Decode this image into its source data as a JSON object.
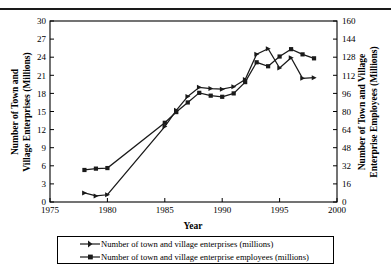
{
  "chart_data": {
    "type": "line",
    "title": "",
    "xlabel": "Year",
    "ylabel": "Number of Town and Village Enterprises (Millions)",
    "y2label": "Number of Town and Village Enterprise Employees (Millions)",
    "xlim": [
      1975,
      2000
    ],
    "xticks": [
      1975,
      1980,
      1985,
      1990,
      1995,
      2000
    ],
    "ylim": [
      0,
      30
    ],
    "yticks": [
      0,
      3,
      6,
      9,
      12,
      15,
      18,
      21,
      24,
      27,
      30
    ],
    "y2lim": [
      0,
      160
    ],
    "y2ticks": [
      0,
      16,
      32,
      48,
      64,
      80,
      96,
      112,
      128,
      144,
      160
    ],
    "grid": false,
    "legend_position": "bottom",
    "series": [
      {
        "name": "Number of town and village enterprises (millions)",
        "axis": "left",
        "marker": "triangle",
        "x": [
          1978,
          1979,
          1980,
          1985,
          1986,
          1987,
          1988,
          1989,
          1990,
          1991,
          1992,
          1993,
          1994,
          1995,
          1996,
          1997,
          1998
        ],
        "values": [
          1.5,
          1.0,
          1.2,
          12.5,
          15.2,
          17.5,
          19.0,
          18.8,
          18.7,
          19.1,
          20.3,
          24.5,
          25.4,
          22.2,
          23.9,
          20.5,
          20.6
        ]
      },
      {
        "name": "Number of town and village enterprise employees (millions)",
        "axis": "right",
        "marker": "square",
        "x": [
          1978,
          1979,
          1980,
          1985,
          1986,
          1987,
          1988,
          1989,
          1990,
          1991,
          1992,
          1993,
          1994,
          1995,
          1996,
          1997,
          1998
        ],
        "values": [
          28.3,
          29.5,
          30.0,
          70.0,
          79.5,
          88.0,
          96.5,
          94.0,
          93.0,
          96.0,
          106.0,
          123.5,
          120.0,
          128.6,
          135.1,
          130.5,
          127.0
        ]
      }
    ]
  },
  "axes": {
    "left_title_lines": [
      "Number of Town and",
      "Village Enterprises (Millions)"
    ],
    "right_title_lines": [
      "Number of Town and Village",
      "Enterprise Employees (Millions)"
    ],
    "x_title": "Year"
  },
  "legend": {
    "entries": [
      {
        "marker": "triangle-line-marker",
        "label": "Number of town and village enterprises (millions)"
      },
      {
        "marker": "square-line-marker",
        "label": "Number of town and village enterprise employees (millions)"
      }
    ]
  },
  "colors": {
    "line": "#1a1a1a",
    "axis": "#000000",
    "background": "#ffffff"
  }
}
